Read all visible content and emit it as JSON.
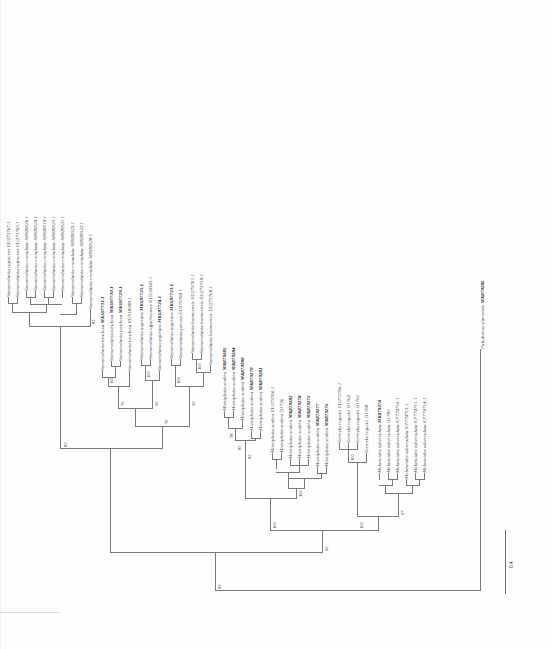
{
  "figure": {
    "type": "phylogenetic-tree",
    "orientation": "rotated-90-counterclockwise",
    "scale_bar_label": "0.4",
    "caption_fragment": "Figure. Maximum likelihood phylogenetic tree"
  },
  "taxa": [
    {
      "id": "t01",
      "name": "Stenomelania rufescens",
      "accession": "EU273767.1",
      "bold": false
    },
    {
      "id": "t02",
      "name": "Stenomelania rufescens",
      "accession": "EU273765.1",
      "bold": false
    },
    {
      "id": "t03",
      "name": "Stenomelania crenulata",
      "accession": "AB920326.1",
      "bold": false
    },
    {
      "id": "t04",
      "name": "Stenomelania crenulata",
      "accession": "AB920324.1",
      "bold": false
    },
    {
      "id": "t05",
      "name": "Stenomelania crenulata",
      "accession": "AB920319.1",
      "bold": false
    },
    {
      "id": "t06",
      "name": "Stenomelania crenulata",
      "accession": "AB920325.1",
      "bold": false
    },
    {
      "id": "t07",
      "name": "Stenomelania crenulata",
      "accession": "AB920321.1",
      "bold": false
    },
    {
      "id": "t08",
      "name": "Stenomelania crenulata",
      "accession": "AB920323.1",
      "bold": false
    },
    {
      "id": "t09",
      "name": "Stenomelania crenulata",
      "accession": "AB920322.1",
      "bold": false
    },
    {
      "id": "t10",
      "name": "Stenomelania crenulata",
      "accession": "AB920320.1",
      "bold": false
    },
    {
      "id": "t11",
      "name": "Stenomelania torulosa",
      "accession": "MK697731.1",
      "bold": true
    },
    {
      "id": "t12",
      "name": "Stenomelania torulosa",
      "accession": "MK697730.1",
      "bold": true
    },
    {
      "id": "t13",
      "name": "Stenomelania torulosa",
      "accession": "MK697729.1",
      "bold": true
    },
    {
      "id": "t14",
      "name": "Stenomelania torulosa",
      "accession": "KU318390.1",
      "bold": false
    },
    {
      "id": "t15",
      "name": "Stenomelania aspirans",
      "accession": "MK697725.1",
      "bold": true
    },
    {
      "id": "t16",
      "name": "Stenomelania offachoensis",
      "accession": "KU318343.1",
      "bold": false
    },
    {
      "id": "t17",
      "name": "Stenomelania aspirans",
      "accession": "MK697724.1",
      "bold": true
    },
    {
      "id": "t18",
      "name": "Stenomelania aspirans",
      "accession": "MK697723.1",
      "bold": true
    },
    {
      "id": "t19",
      "name": "Stenomelania juncea",
      "accession": "EU273769.1",
      "bold": false
    },
    {
      "id": "t20",
      "name": "Stenomelania bonneensis",
      "accession": "EU273761.1",
      "bold": false
    },
    {
      "id": "t21",
      "name": "Stenomelania bonneensis",
      "accession": "EU273759.1",
      "bold": false
    },
    {
      "id": "t22",
      "name": "Stenomelania bonneensis",
      "accession": "EU273760.1",
      "bold": false
    },
    {
      "id": "t23",
      "name": "Mieniplotia scabra",
      "accession": "MK879285",
      "bold": true
    },
    {
      "id": "t24",
      "name": "Mieniplotia scabra",
      "accession": "MK879284",
      "bold": true
    },
    {
      "id": "t25",
      "name": "Mieniplotia scabra",
      "accession": "MK879280",
      "bold": true
    },
    {
      "id": "t26",
      "name": "Mieniplotia scabra",
      "accession": "MK879279",
      "bold": true
    },
    {
      "id": "t27",
      "name": "Mieniplotia scabra",
      "accession": "MK879281",
      "bold": true
    },
    {
      "id": "t28",
      "name": "Mieniplotia scabra",
      "accession": "EU273766.1",
      "bold": false
    },
    {
      "id": "t29",
      "name": "Mieniplotia scabra",
      "accession": "D1736",
      "bold": false
    },
    {
      "id": "t30",
      "name": "Mieniplotia scabra",
      "accession": "MK879282",
      "bold": true
    },
    {
      "id": "t31",
      "name": "Mieniplotia scabra",
      "accession": "MK879278",
      "bold": true
    },
    {
      "id": "t32",
      "name": "Mieniplotia scabra",
      "accession": "MK879275",
      "bold": true
    },
    {
      "id": "t33",
      "name": "Mieniplotia scabra",
      "accession": "MK879277",
      "bold": true
    },
    {
      "id": "t34",
      "name": "Mieniplotia scabra",
      "accession": "MK879276",
      "bold": true
    },
    {
      "id": "t35",
      "name": "Sermyla riquetii",
      "accession": "EU273766.1",
      "bold": false
    },
    {
      "id": "t36",
      "name": "Sermyla riquetii",
      "accession": "D1762",
      "bold": false
    },
    {
      "id": "t37",
      "name": "Sermyla riquetii",
      "accession": "D1761",
      "bold": false
    },
    {
      "id": "t38",
      "name": "Sermyla riquetii",
      "accession": "D1760",
      "bold": false
    },
    {
      "id": "t39",
      "name": "Melanoides tuberculata",
      "accession": "MK879274",
      "bold": true
    },
    {
      "id": "t40",
      "name": "Melanoides tuberculata",
      "accession": "D1705",
      "bold": false
    },
    {
      "id": "t41",
      "name": "Melanoides tuberculata",
      "accession": "KP774716.1",
      "bold": false
    },
    {
      "id": "t42",
      "name": "Melanoides tuberculata",
      "accession": "KP774713.1",
      "bold": false
    },
    {
      "id": "t43",
      "name": "Melanoides tuberculata",
      "accession": "KP774715.1",
      "bold": false
    },
    {
      "id": "t44",
      "name": "Melanoides tuberculata",
      "accession": "KP774714.1",
      "bold": false
    },
    {
      "id": "t45",
      "name": "Paludomus siamensis",
      "accession": "MK879286",
      "bold": true
    }
  ],
  "bootstrap_values": [
    {
      "id": "b01",
      "value": "82"
    },
    {
      "id": "b02",
      "value": "79"
    },
    {
      "id": "b03",
      "value": "100"
    },
    {
      "id": "b04",
      "value": "100"
    },
    {
      "id": "b05",
      "value": "99"
    },
    {
      "id": "b06",
      "value": "100"
    },
    {
      "id": "b07",
      "value": "99"
    },
    {
      "id": "b08",
      "value": "100"
    },
    {
      "id": "b09",
      "value": "70"
    },
    {
      "id": "b10",
      "value": "82"
    },
    {
      "id": "b11",
      "value": "78"
    },
    {
      "id": "b12",
      "value": "85"
    },
    {
      "id": "b13",
      "value": "100"
    },
    {
      "id": "b14",
      "value": "82"
    },
    {
      "id": "b15",
      "value": "100"
    },
    {
      "id": "b16",
      "value": "100"
    },
    {
      "id": "b17",
      "value": "97"
    },
    {
      "id": "b18",
      "value": "100"
    },
    {
      "id": "b19",
      "value": "69"
    },
    {
      "id": "b20",
      "value": "82"
    }
  ],
  "colors": {
    "line": "#7a7a7a",
    "text": "#3a3a3a",
    "bold_text": "#202020",
    "background": "#fefefe"
  }
}
